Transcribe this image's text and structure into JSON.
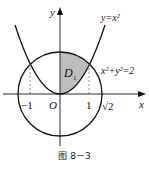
{
  "figure": {
    "caption": "图 8－3",
    "axes": {
      "x_label": "x",
      "y_label": "y",
      "origin_label": "O"
    },
    "ticks": {
      "neg_one": "−1",
      "one": "1",
      "sqrt2": "√2"
    },
    "curves": {
      "parabola": {
        "label": "y=x²",
        "equation": "y = x^2"
      },
      "circle": {
        "label": "x²+y²=2",
        "equation": "x^2 + y^2 = 2",
        "radius": "√2"
      }
    },
    "region": {
      "label": "D",
      "subscript": "1",
      "fill": "#bdbdbd"
    },
    "colors": {
      "stroke": "#111111",
      "shade": "#bdbdbd",
      "dashed": "#777777"
    }
  }
}
